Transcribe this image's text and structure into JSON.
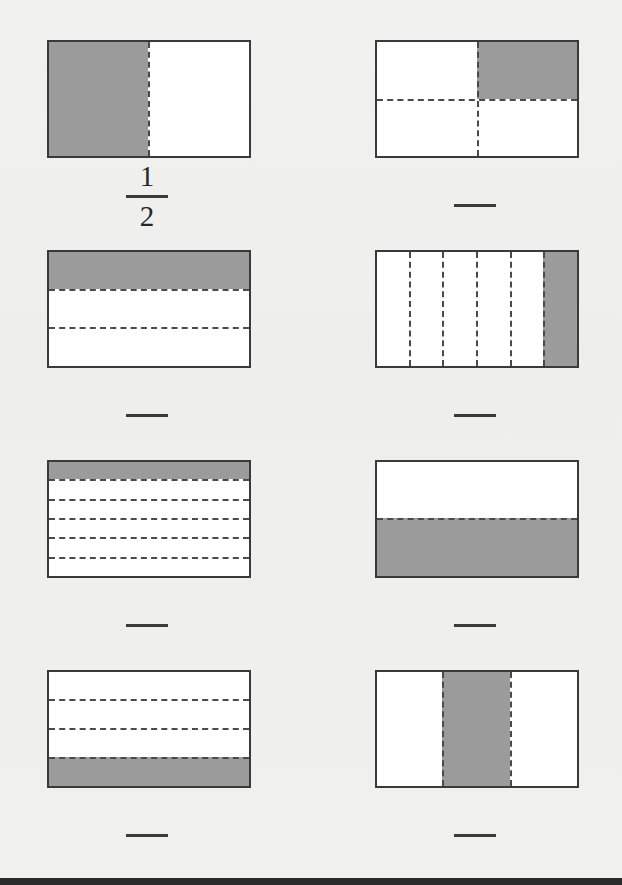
{
  "worksheet": {
    "title": "Fraction shading worksheet",
    "background_color": "#efefed",
    "shade_color": "#9b9b9b",
    "line_color": "#3a3a3a",
    "dash_color": "#4a4a4a",
    "columns": 2,
    "rows": 4
  },
  "figures": [
    {
      "id": "fig-1",
      "position": "row1-left",
      "orientation": "vertical-halves",
      "parts": 2,
      "shaded_parts": 1,
      "shaded_indices": [
        0
      ],
      "answer_shown": true,
      "numerator": "1",
      "denominator": "2",
      "fraction_text": "1/2"
    },
    {
      "id": "fig-2",
      "position": "row1-right",
      "orientation": "two-by-two-grid",
      "parts": 4,
      "shaded_parts": 1,
      "shaded_indices": [
        1
      ],
      "shaded_quadrant": "top-right",
      "answer_shown": false,
      "numerator": "1",
      "denominator": "4",
      "fraction_text": ""
    },
    {
      "id": "fig-3",
      "position": "row2-left",
      "orientation": "horizontal-strips",
      "parts": 3,
      "shaded_parts": 1,
      "shaded_indices": [
        0
      ],
      "answer_shown": false,
      "numerator": "1",
      "denominator": "3",
      "fraction_text": ""
    },
    {
      "id": "fig-4",
      "position": "row2-right",
      "orientation": "vertical-strips",
      "parts": 6,
      "shaded_parts": 1,
      "shaded_indices": [
        5
      ],
      "answer_shown": false,
      "numerator": "1",
      "denominator": "6",
      "fraction_text": ""
    },
    {
      "id": "fig-5",
      "position": "row3-left",
      "orientation": "horizontal-strips",
      "parts": 6,
      "shaded_parts": 1,
      "shaded_indices": [
        0
      ],
      "answer_shown": false,
      "numerator": "1",
      "denominator": "6",
      "fraction_text": ""
    },
    {
      "id": "fig-6",
      "position": "row3-right",
      "orientation": "horizontal-strips",
      "parts": 2,
      "shaded_parts": 1,
      "shaded_indices": [
        1
      ],
      "answer_shown": false,
      "numerator": "1",
      "denominator": "2",
      "fraction_text": ""
    },
    {
      "id": "fig-7",
      "position": "row4-left",
      "orientation": "horizontal-strips",
      "parts": 4,
      "shaded_parts": 1,
      "shaded_indices": [
        3
      ],
      "answer_shown": false,
      "numerator": "1",
      "denominator": "4",
      "fraction_text": ""
    },
    {
      "id": "fig-8",
      "position": "row4-right",
      "orientation": "vertical-strips",
      "parts": 3,
      "shaded_parts": 1,
      "shaded_indices": [
        1
      ],
      "answer_shown": false,
      "numerator": "1",
      "denominator": "3",
      "fraction_text": ""
    }
  ],
  "answers": {
    "fig_1": {
      "numerator": "1",
      "denominator": "2"
    },
    "fig_2": {
      "numerator": "",
      "denominator": ""
    },
    "fig_3": {
      "numerator": "",
      "denominator": ""
    },
    "fig_4": {
      "numerator": "",
      "denominator": ""
    },
    "fig_5": {
      "numerator": "",
      "denominator": ""
    },
    "fig_6": {
      "numerator": "",
      "denominator": ""
    },
    "fig_7": {
      "numerator": "",
      "denominator": ""
    },
    "fig_8": {
      "numerator": "",
      "denominator": ""
    }
  }
}
